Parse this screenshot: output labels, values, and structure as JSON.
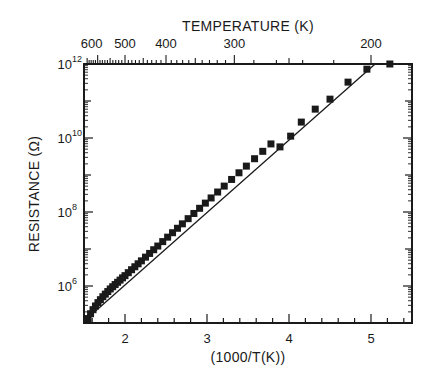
{
  "chart_data": {
    "type": "scatter",
    "title": "",
    "xlabel": "(1000/T(K))",
    "ylabel": "RESISTANCE (Ω)",
    "top_xlabel": "TEMPERATURE (K)",
    "xlim": [
      1.5,
      5.5
    ],
    "ylim_log10": [
      5,
      12
    ],
    "yscale": "log",
    "grid": false,
    "legend": null,
    "x_ticks": [
      2,
      3,
      4,
      5
    ],
    "x_tick_labels": [
      "2",
      "3",
      "4",
      "5"
    ],
    "y_ticks_log10": [
      6,
      8,
      10,
      12
    ],
    "y_tick_labels": [
      {
        "base": "10",
        "exp": "6"
      },
      {
        "base": "10",
        "exp": "8"
      },
      {
        "base": "10",
        "exp": "10"
      },
      {
        "base": "10",
        "exp": "12"
      }
    ],
    "top_ticks_temperature": [
      600,
      500,
      400,
      300,
      200
    ],
    "top_tick_labels": [
      "600",
      "500",
      "400",
      "300",
      "200"
    ],
    "series": [
      {
        "name": "measured",
        "marker": "square",
        "x": [
          1.55,
          1.58,
          1.61,
          1.64,
          1.67,
          1.7,
          1.73,
          1.76,
          1.79,
          1.82,
          1.85,
          1.88,
          1.91,
          1.94,
          1.97,
          2.0,
          2.04,
          2.08,
          2.12,
          2.16,
          2.2,
          2.25,
          2.3,
          2.35,
          2.4,
          2.46,
          2.52,
          2.58,
          2.64,
          2.7,
          2.77,
          2.84,
          2.91,
          2.98,
          3.05,
          3.13,
          3.21,
          3.3,
          3.39,
          3.48,
          3.58,
          3.68,
          3.78,
          3.89,
          4.02,
          4.15,
          4.32,
          4.5,
          4.72,
          4.95,
          5.23
        ],
        "log10_values": [
          5.12,
          5.25,
          5.36,
          5.46,
          5.55,
          5.63,
          5.71,
          5.78,
          5.85,
          5.92,
          5.98,
          6.04,
          6.1,
          6.16,
          6.22,
          6.28,
          6.36,
          6.44,
          6.52,
          6.6,
          6.68,
          6.78,
          6.88,
          6.98,
          7.08,
          7.2,
          7.32,
          7.44,
          7.56,
          7.68,
          7.82,
          7.96,
          8.1,
          8.24,
          8.38,
          8.54,
          8.7,
          8.88,
          9.06,
          9.24,
          9.44,
          9.64,
          9.84,
          9.76,
          10.05,
          10.43,
          10.78,
          11.05,
          11.51,
          11.86,
          12.0
        ]
      }
    ],
    "fit_line": {
      "name": "fit",
      "x": [
        1.5,
        5.05
      ],
      "log10_values": [
        5.05,
        12.0
      ]
    }
  }
}
